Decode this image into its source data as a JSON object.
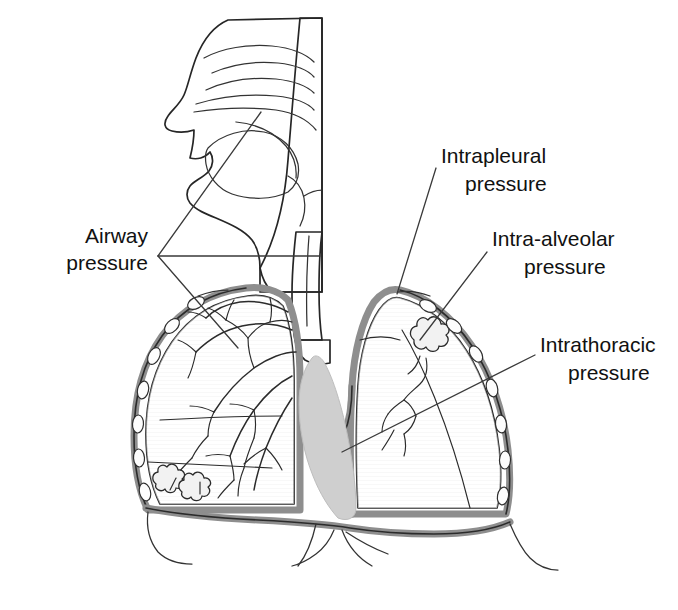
{
  "figure": {
    "background_color": "#ffffff",
    "ink_color": "#262626",
    "label_color": "#111111",
    "tissue_fill": "#d9d9d9",
    "lung_fill": "#ececec",
    "pleura_fill": "#8e8e8e",
    "heart_fill": "#cfcfcf",
    "rib_fill": "#fdfdfd"
  },
  "labels": [
    {
      "id": "airway",
      "name": "airway-pressure-label",
      "line1": "Airway",
      "line2": "pressure",
      "anchor": "end",
      "x": 148,
      "y1": 243,
      "y2": 270,
      "leaders": 2,
      "target": "upper airway / oropharynx and trachea"
    },
    {
      "id": "intrapleural",
      "name": "intrapleural-pressure-label",
      "line1": "Intrapleural",
      "line2": "pressure",
      "anchor": "start",
      "x": 441,
      "y1": 163,
      "y2": 191,
      "leaders": 1,
      "target": "pleural membrane at right lung apex"
    },
    {
      "id": "intra-alveolar",
      "name": "intra-alveolar-pressure-label",
      "line1": "Intra-alveolar",
      "line2": "pressure",
      "anchor": "start",
      "x": 492,
      "y1": 246,
      "y2": 274,
      "leaders": 1,
      "target": "alveolar cluster in right lung"
    },
    {
      "id": "intrathoracic",
      "name": "intrathoracic-pressure-label",
      "line1": "Intrathoracic",
      "line2": "pressure",
      "anchor": "start",
      "x": 540,
      "y1": 352,
      "y2": 380,
      "leaders": 1,
      "target": "thoracic cavity / mediastinum"
    }
  ],
  "structures": [
    {
      "name": "head-and-nasal-cavity",
      "label": "Head, nasal cavity and turbinates"
    },
    {
      "name": "tongue",
      "label": "Tongue"
    },
    {
      "name": "pharynx",
      "label": "Pharynx"
    },
    {
      "name": "larynx-epiglottis",
      "label": "Larynx and epiglottis"
    },
    {
      "name": "trachea",
      "label": "Trachea"
    },
    {
      "name": "left-lung",
      "label": "Left lung (viewer left)"
    },
    {
      "name": "right-lung",
      "label": "Right lung (viewer right)"
    },
    {
      "name": "bronchial-tree",
      "label": "Bronchial tree"
    },
    {
      "name": "alveolar-cluster",
      "label": "Alveolar clusters"
    },
    {
      "name": "pleural-membrane",
      "label": "Pleural membrane"
    },
    {
      "name": "rib",
      "label": "Rib cross-sections"
    },
    {
      "name": "heart",
      "label": "Heart"
    },
    {
      "name": "diaphragm",
      "label": "Diaphragm"
    }
  ]
}
